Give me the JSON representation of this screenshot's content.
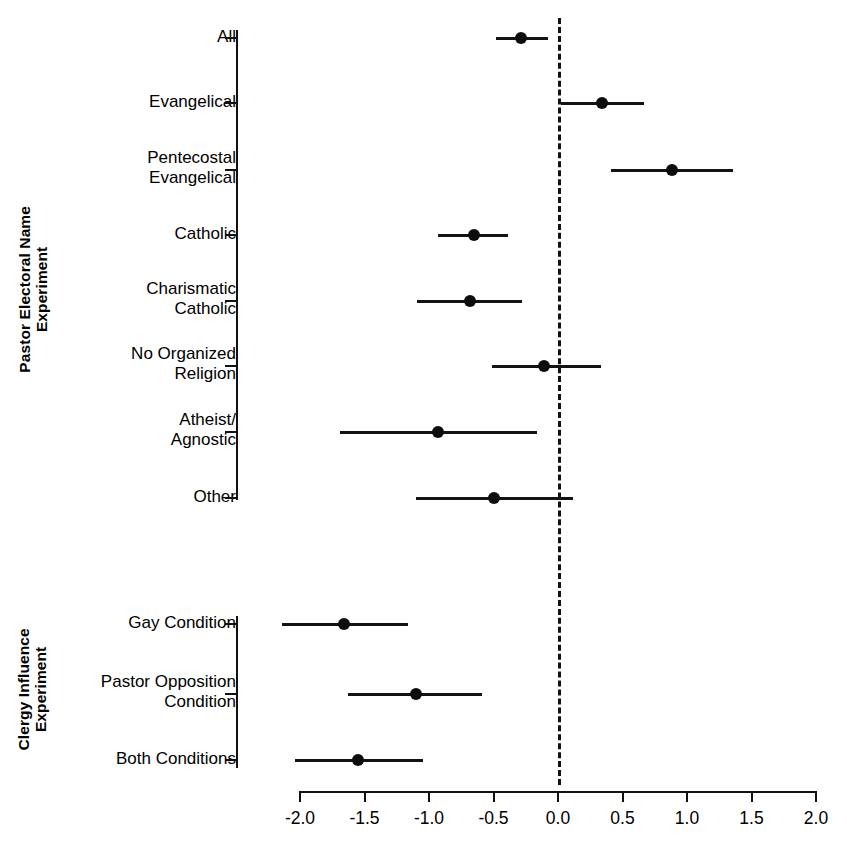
{
  "chart_data": {
    "type": "scatter",
    "subtype": "forest-plot",
    "title": "",
    "xlabel": "",
    "ylabel": "",
    "xlim": [
      -2.0,
      2.0
    ],
    "xticks": [
      -2.0,
      -1.5,
      -1.0,
      -0.5,
      0.0,
      0.5,
      1.0,
      1.5,
      2.0
    ],
    "xticklabels": [
      "-2.0",
      "-1.5",
      "-1.0",
      "-0.5",
      "0.0",
      "0.5",
      "1.0",
      "1.5",
      "2.0"
    ],
    "grid": false,
    "legend": false,
    "reference_line": {
      "value": 0.0,
      "style": "dashed",
      "color": "#111111"
    },
    "groups": [
      {
        "name": "Pastor Electoral Name Experiment",
        "label_lines": "Pastor Electoral Name\nExperiment",
        "points": [
          {
            "label": "All",
            "label_lines": "All",
            "estimate": -0.29,
            "low": -0.48,
            "high": -0.08
          },
          {
            "label": "Evangelical",
            "label_lines": "Evangelical",
            "estimate": 0.34,
            "low": 0.02,
            "high": 0.67
          },
          {
            "label": "Pentecostal Evangelical",
            "label_lines": "Pentecostal\nEvangelical",
            "estimate": 0.88,
            "low": 0.41,
            "high": 1.36
          },
          {
            "label": "Catholic",
            "label_lines": "Catholic",
            "estimate": -0.65,
            "low": -0.93,
            "high": -0.39
          },
          {
            "label": "Charismatic Catholic",
            "label_lines": "Charismatic\nCatholic",
            "estimate": -0.68,
            "low": -1.09,
            "high": -0.28
          },
          {
            "label": "No Organized Religion",
            "label_lines": "No Organized\nReligion",
            "estimate": -0.11,
            "low": -0.51,
            "high": 0.33
          },
          {
            "label": "Atheist/Agnostic",
            "label_lines": "Atheist/\nAgnostic",
            "estimate": -0.93,
            "low": -1.69,
            "high": -0.16
          },
          {
            "label": "Other",
            "label_lines": "Other",
            "estimate": -0.5,
            "low": -1.1,
            "high": 0.12
          }
        ]
      },
      {
        "name": "Clergy Influence Experiment",
        "label_lines": "Clergy Influence\nExperiment",
        "points": [
          {
            "label": "Gay Condition",
            "label_lines": "Gay Condition",
            "estimate": -1.66,
            "low": -2.14,
            "high": -1.16
          },
          {
            "label": "Pastor Opposition Condition",
            "label_lines": "Pastor Opposition\nCondition",
            "estimate": -1.1,
            "low": -1.63,
            "high": -0.59
          },
          {
            "label": "Both Conditions",
            "label_lines": "Both Conditions",
            "estimate": -1.55,
            "low": -2.04,
            "high": -1.05
          }
        ]
      }
    ]
  },
  "axis": {
    "group_label_1": "Pastor Electoral Name\nExperiment",
    "group_label_2": "Clergy Influence\nExperiment",
    "tick_0": "-2.0",
    "tick_1": "-1.5",
    "tick_2": "-1.0",
    "tick_3": "-0.5",
    "tick_4": "0.0",
    "tick_5": "0.5",
    "tick_6": "1.0",
    "tick_7": "1.5",
    "tick_8": "2.0"
  },
  "rows": {
    "r0": "All",
    "r1": "Evangelical",
    "r2": "Pentecostal\nEvangelical",
    "r3": "Catholic",
    "r4": "Charismatic\nCatholic",
    "r5": "No Organized\nReligion",
    "r6": "Atheist/\nAgnostic",
    "r7": "Other",
    "r8": "Gay Condition",
    "r9": "Pastor Opposition\nCondition",
    "r10": "Both Conditions"
  },
  "colors": {
    "ink": "#111111",
    "marker": "#0d0d0d",
    "background": "#ffffff"
  }
}
